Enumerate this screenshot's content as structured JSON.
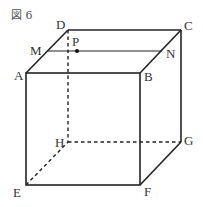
{
  "figure": {
    "caption": "図 6",
    "vertices": {
      "A": "A",
      "B": "B",
      "C": "C",
      "D": "D",
      "E": "E",
      "F": "F",
      "G": "G",
      "H": "H",
      "M": "M",
      "N": "N",
      "P": "P"
    },
    "colors": {
      "line": "#222222",
      "label": "#333333"
    }
  }
}
